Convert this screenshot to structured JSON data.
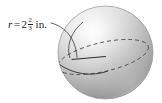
{
  "figure": {
    "type": "geometry-diagram",
    "shape": "sphere",
    "background_color": "#ffffff"
  },
  "label": {
    "variable": "r",
    "equals": "=",
    "whole_number": "2",
    "fraction_numerator": "2",
    "fraction_denominator": "3",
    "unit": "in.",
    "full_text": "r = 2 2/3 in.",
    "text_color": "#1a1a1a"
  },
  "sphere": {
    "center_x": 105.5,
    "center_y": 52.5,
    "radius_x": 47.5,
    "radius_y": 46.5,
    "highlight_color": "#ffffff",
    "midtone_color": "#c9c9c9",
    "shadow_color": "#8d8d8d",
    "edge_color": "#a3a3a3",
    "outline_color": "#9a9a9a"
  },
  "great_circle": {
    "description": "equatorial ellipse tilted across sphere",
    "solid_stroke_color": "#2b2b2b",
    "dashed_stroke_color": "#4a4a4a",
    "dash_pattern": "4 3",
    "stroke_width": 0.9
  },
  "radius_segment": {
    "description": "radius line drawn from center toward front-left of great circle",
    "stroke_color": "#2b2b2b",
    "stroke_width": 1.0
  },
  "leader_line": {
    "description": "curved pointer from radius label to radius endpoint on sphere",
    "stroke_color": "#3a3a3a",
    "stroke_width": 0.8
  }
}
